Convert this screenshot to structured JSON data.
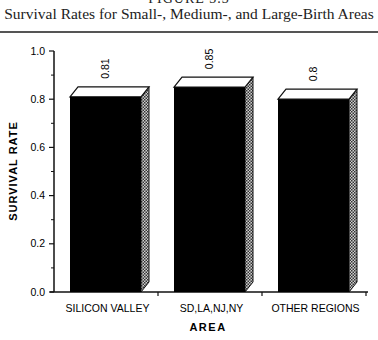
{
  "figure": {
    "heading": "FIGURE 3.3",
    "title": "Survival Rates for Small-, Medium-, and Large-Birth Areas"
  },
  "chart_data": {
    "type": "bar",
    "title": "Survival Rates for Small-, Medium-, and Large-Birth Areas",
    "xlabel": "AREA",
    "ylabel": "SURVIVAL  RATE",
    "categories": [
      "SILICON VALLEY",
      "SD,LA,NJ,NY",
      "OTHER REGIONS"
    ],
    "values": [
      0.81,
      0.85,
      0.8
    ],
    "value_labels": [
      "0.81",
      "0.85",
      "0.8"
    ],
    "ylim": [
      0,
      1.0
    ],
    "yticks": [
      "0.0",
      "0.2",
      "0.4",
      "0.6",
      "0.8",
      "1.0"
    ],
    "grid": false,
    "style": "3d-bar",
    "colors": {
      "bar_front": "#000000",
      "bar_top": "#ffffff",
      "bar_side": "#888888"
    }
  }
}
